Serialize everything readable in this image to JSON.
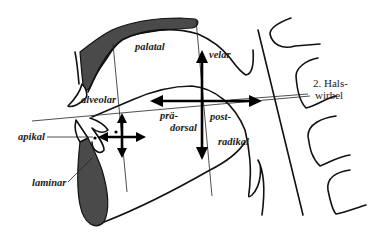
{
  "diagram": {
    "labels": {
      "palatal": "palatal",
      "velar": "velar",
      "alveolar": "alveolar",
      "prae": "prä-",
      "dorsal": "dorsal",
      "post": "post-",
      "radikal": "radikal",
      "apikal": "apikal",
      "laminar": "laminar",
      "hals_line1": "2. Hals-",
      "hals_line2": "wirbel"
    },
    "colors": {
      "ink": "#111111",
      "fill_dark": "#4a4a4a",
      "background": "#ffffff"
    }
  }
}
